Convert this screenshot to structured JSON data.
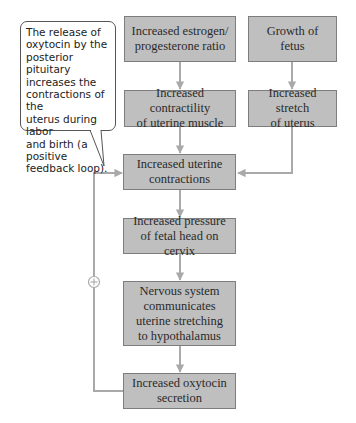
{
  "diagram": {
    "callout": {
      "text": "The release of\noxytocin by the\nposterior pituitary\nincreases the\ncontractions of the\nuterus during labor\nand birth (a positive\nfeedback loop)."
    },
    "nodes": [
      {
        "id": "estrogen_ratio",
        "label": "Increased estrogen/\nprogesterone ratio"
      },
      {
        "id": "fetus_growth",
        "label": "Growth of\nfetus"
      },
      {
        "id": "contractility",
        "label": "Increased contractility\nof uterine muscle"
      },
      {
        "id": "stretch",
        "label": "Increased stretch\nof uterus"
      },
      {
        "id": "contractions",
        "label": "Increased uterine\ncontractions"
      },
      {
        "id": "pressure",
        "label": "Increased pressure\nof fetal head on cervix"
      },
      {
        "id": "nervous",
        "label": "Nervous system\ncommunicates\nuterine stretching\nto hypothalamus"
      },
      {
        "id": "oxytocin",
        "label": "Increased oxytocin\nsecretion"
      }
    ],
    "edges": [
      {
        "from": "estrogen_ratio",
        "to": "contractility"
      },
      {
        "from": "fetus_growth",
        "to": "stretch"
      },
      {
        "from": "contractility",
        "to": "contractions"
      },
      {
        "from": "stretch",
        "to": "contractions"
      },
      {
        "from": "contractions",
        "to": "pressure"
      },
      {
        "from": "pressure",
        "to": "nervous"
      },
      {
        "from": "nervous",
        "to": "oxytocin"
      },
      {
        "from": "oxytocin",
        "to": "contractions",
        "sign": "+"
      }
    ],
    "feedback_sign": "+",
    "colors": {
      "box_fill": "#bfbfbf",
      "box_border": "#7d7d7d",
      "arrow": "#a9a9a9",
      "text": "#2a2a2a"
    }
  }
}
